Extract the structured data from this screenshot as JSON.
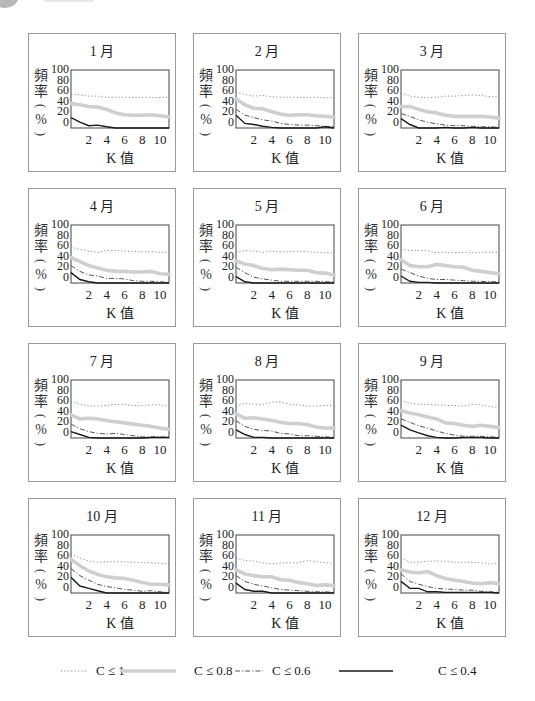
{
  "header": {
    "bullet_icon": "circle-bullet",
    "text": ""
  },
  "axes": {
    "ylabel": [
      "頻",
      "率",
      "(",
      "%",
      ")"
    ],
    "yticks": [
      "100",
      "80",
      "60",
      "40",
      "20",
      "0"
    ],
    "xticks": [
      "2",
      "4",
      "6",
      "8",
      "10"
    ],
    "xlabel": "K 值"
  },
  "legend": [
    {
      "key": "c1",
      "label": "C ≤ 1",
      "style": "dotted",
      "color": "#8c8c8c"
    },
    {
      "key": "c08",
      "label": "C ≤ 0.8",
      "style": "thick",
      "color": "#cfcfcf"
    },
    {
      "key": "c06",
      "label": "C ≤ 0.6",
      "style": "dash-dot",
      "color": "#555555"
    },
    {
      "key": "c04",
      "label": "C ≤ 0.4",
      "style": "solid",
      "color": "#1a1a1a"
    }
  ],
  "panels": [
    {
      "title": "1 月"
    },
    {
      "title": "2 月"
    },
    {
      "title": "3 月"
    },
    {
      "title": "4 月"
    },
    {
      "title": "5 月"
    },
    {
      "title": "6 月"
    },
    {
      "title": "7 月"
    },
    {
      "title": "8 月"
    },
    {
      "title": "9 月"
    },
    {
      "title": "10 月"
    },
    {
      "title": "11 月"
    },
    {
      "title": "12 月"
    }
  ],
  "chart_data": {
    "type": "line",
    "layout": "3x4 small multiples, one panel per month",
    "xlabel": "K 值",
    "ylabel": "頻率 (%)",
    "xlim": [
      0,
      11
    ],
    "ylim": [
      0,
      100
    ],
    "xticks": [
      2,
      4,
      6,
      8,
      10
    ],
    "yticks": [
      0,
      20,
      40,
      60,
      80,
      100
    ],
    "grid": false,
    "legend_position": "bottom",
    "x": [
      0,
      1,
      2,
      3,
      4,
      5,
      6,
      7,
      8,
      9,
      10,
      11
    ],
    "panels": [
      {
        "title": "1月",
        "series": [
          {
            "name": "C ≤ 1",
            "values": [
              58,
              57,
              55,
              55,
              53,
              53,
              53,
              53,
              53,
              52,
              53,
              53
            ]
          },
          {
            "name": "C ≤ 0.8",
            "values": [
              42,
              40,
              37,
              36,
              32,
              26,
              23,
              22,
              22,
              23,
              21,
              19
            ]
          },
          {
            "name": "C ≤ 0.6",
            "values": null
          },
          {
            "name": "C ≤ 0.4",
            "values": [
              18,
              10,
              4,
              5,
              2,
              0,
              0,
              0,
              0,
              0,
              0,
              0
            ]
          }
        ]
      },
      {
        "title": "2月",
        "series": [
          {
            "name": "C ≤ 1",
            "values": [
              62,
              58,
              55,
              56,
              54,
              53,
              53,
              53,
              53,
              53,
              52,
              52
            ]
          },
          {
            "name": "C ≤ 0.8",
            "values": [
              50,
              40,
              34,
              33,
              28,
              24,
              22,
              23,
              23,
              21,
              20,
              19
            ]
          },
          {
            "name": "C ≤ 0.6",
            "values": [
              32,
              22,
              18,
              14,
              12,
              8,
              6,
              5,
              5,
              4,
              3,
              2
            ]
          },
          {
            "name": "C ≤ 0.4",
            "values": [
              22,
              8,
              6,
              3,
              1,
              0,
              0,
              0,
              0,
              0,
              2,
              0
            ]
          }
        ]
      },
      {
        "title": "3月",
        "series": [
          {
            "name": "C ≤ 1",
            "values": [
              60,
              55,
              53,
              52,
              53,
              55,
              55,
              56,
              57,
              56,
              54,
              54
            ]
          },
          {
            "name": "C ≤ 0.8",
            "values": [
              37,
              37,
              32,
              28,
              26,
              22,
              20,
              20,
              20,
              20,
              19,
              17
            ]
          },
          {
            "name": "C ≤ 0.6",
            "values": [
              25,
              20,
              14,
              10,
              7,
              5,
              4,
              4,
              3,
              2,
              2,
              1
            ]
          },
          {
            "name": "C ≤ 0.4",
            "values": [
              16,
              6,
              0,
              0,
              0,
              1,
              0,
              0,
              1,
              0,
              0,
              0
            ]
          }
        ]
      },
      {
        "title": "4月",
        "series": [
          {
            "name": "C ≤ 1",
            "values": [
              62,
              58,
              55,
              53,
              56,
              56,
              55,
              54,
              54,
              54,
              53,
              53
            ]
          },
          {
            "name": "C ≤ 0.8",
            "values": [
              44,
              37,
              30,
              26,
              22,
              20,
              20,
              19,
              19,
              20,
              16,
              15
            ]
          },
          {
            "name": "C ≤ 0.6",
            "values": [
              30,
              20,
              14,
              12,
              8,
              8,
              7,
              4,
              3,
              3,
              2,
              1
            ]
          },
          {
            "name": "C ≤ 0.4",
            "values": [
              18,
              6,
              2,
              0,
              0,
              0,
              0,
              0,
              0,
              0,
              0,
              0
            ]
          }
        ]
      },
      {
        "title": "5月",
        "series": [
          {
            "name": "C ≤ 1",
            "values": [
              53,
              56,
              55,
              53,
              55,
              54,
              54,
              55,
              54,
              53,
              52,
              52
            ]
          },
          {
            "name": "C ≤ 0.8",
            "values": [
              38,
              33,
              30,
              25,
              23,
              24,
              23,
              22,
              22,
              18,
              17,
              14
            ]
          },
          {
            "name": "C ≤ 0.6",
            "values": [
              27,
              18,
              10,
              7,
              5,
              3,
              3,
              3,
              3,
              3,
              2,
              2
            ]
          },
          {
            "name": "C ≤ 0.4",
            "values": [
              11,
              2,
              0,
              0,
              0,
              0,
              0,
              0,
              0,
              0,
              0,
              0
            ]
          }
        ]
      },
      {
        "title": "6月",
        "series": [
          {
            "name": "C ≤ 1",
            "values": [
              58,
              56,
              56,
              56,
              52,
              53,
              52,
              53,
              52,
              53,
              53,
              53
            ]
          },
          {
            "name": "C ≤ 0.8",
            "values": [
              40,
              30,
              28,
              28,
              32,
              30,
              28,
              27,
              22,
              20,
              18,
              16
            ]
          },
          {
            "name": "C ≤ 0.6",
            "values": [
              24,
              18,
              12,
              8,
              6,
              6,
              5,
              4,
              3,
              3,
              2,
              2
            ]
          },
          {
            "name": "C ≤ 0.4",
            "values": [
              12,
              3,
              1,
              1,
              0,
              0,
              0,
              0,
              0,
              0,
              0,
              0
            ]
          }
        ]
      },
      {
        "title": "7月",
        "series": [
          {
            "name": "C ≤ 1",
            "values": [
              63,
              58,
              55,
              55,
              56,
              58,
              58,
              56,
              56,
              57,
              57,
              55
            ]
          },
          {
            "name": "C ≤ 0.8",
            "values": [
              40,
              33,
              34,
              33,
              30,
              28,
              26,
              24,
              22,
              20,
              17,
              15
            ]
          },
          {
            "name": "C ≤ 0.6",
            "values": [
              24,
              16,
              11,
              8,
              7,
              8,
              6,
              4,
              2,
              2,
              2,
              1
            ]
          },
          {
            "name": "C ≤ 0.4",
            "values": [
              11,
              6,
              1,
              0,
              0,
              0,
              0,
              0,
              0,
              1,
              1,
              1
            ]
          }
        ]
      },
      {
        "title": "8月",
        "series": [
          {
            "name": "C ≤ 1",
            "values": [
              55,
              60,
              58,
              58,
              62,
              62,
              58,
              57,
              55,
              55,
              56,
              56
            ]
          },
          {
            "name": "C ≤ 0.8",
            "values": [
              42,
              34,
              35,
              33,
              30,
              27,
              25,
              25,
              23,
              19,
              17,
              17
            ]
          },
          {
            "name": "C ≤ 0.6",
            "values": [
              30,
              20,
              15,
              13,
              12,
              8,
              7,
              4,
              4,
              3,
              2,
              1
            ]
          },
          {
            "name": "C ≤ 0.4",
            "values": [
              14,
              6,
              1,
              1,
              0,
              0,
              0,
              0,
              0,
              0,
              0,
              0
            ]
          }
        ]
      },
      {
        "title": "9月",
        "series": [
          {
            "name": "C ≤ 1",
            "values": [
              65,
              60,
              58,
              58,
              57,
              56,
              56,
              55,
              58,
              57,
              54,
              53
            ]
          },
          {
            "name": "C ≤ 0.8",
            "values": [
              47,
              43,
              40,
              36,
              33,
              26,
              25,
              22,
              20,
              22,
              20,
              18
            ]
          },
          {
            "name": "C ≤ 0.6",
            "values": [
              33,
              27,
              21,
              17,
              12,
              8,
              5,
              3,
              3,
              3,
              2,
              1
            ]
          },
          {
            "name": "C ≤ 0.4",
            "values": [
              22,
              14,
              9,
              4,
              1,
              0,
              0,
              1,
              1,
              1,
              0,
              0
            ]
          }
        ]
      },
      {
        "title": "10月",
        "series": [
          {
            "name": "C ≤ 1",
            "values": [
              67,
              60,
              55,
              53,
              54,
              54,
              54,
              53,
              52,
              52,
              51,
              50
            ]
          },
          {
            "name": "C ≤ 0.8",
            "values": [
              58,
              47,
              38,
              32,
              28,
              26,
              25,
              22,
              18,
              15,
              15,
              14
            ]
          },
          {
            "name": "C ≤ 0.6",
            "values": [
              42,
              30,
              22,
              15,
              11,
              9,
              6,
              5,
              3,
              4,
              2,
              1
            ]
          },
          {
            "name": "C ≤ 0.4",
            "values": [
              27,
              12,
              8,
              4,
              0,
              0,
              0,
              0,
              0,
              0,
              0,
              0
            ]
          }
        ]
      },
      {
        "title": "11月",
        "series": [
          {
            "name": "C ≤ 1",
            "values": [
              60,
              56,
              55,
              52,
              50,
              52,
              52,
              52,
              56,
              54,
              52,
              51
            ]
          },
          {
            "name": "C ≤ 0.8",
            "values": [
              40,
              33,
              30,
              28,
              28,
              23,
              22,
              18,
              16,
              13,
              14,
              13
            ]
          },
          {
            "name": "C ≤ 0.6",
            "values": [
              30,
              20,
              15,
              12,
              9,
              6,
              5,
              4,
              3,
              2,
              2,
              1
            ]
          },
          {
            "name": "C ≤ 0.4",
            "values": [
              17,
              6,
              3,
              3,
              0,
              0,
              0,
              0,
              0,
              0,
              0,
              0
            ]
          }
        ]
      },
      {
        "title": "12月",
        "series": [
          {
            "name": "C ≤ 1",
            "values": [
              60,
              53,
              53,
              55,
              55,
              55,
              53,
              53,
              53,
              52,
              50,
              51
            ]
          },
          {
            "name": "C ≤ 0.8",
            "values": [
              40,
              36,
              35,
              37,
              30,
              25,
              22,
              20,
              17,
              16,
              18,
              16
            ]
          },
          {
            "name": "C ≤ 0.6",
            "values": [
              33,
              20,
              15,
              11,
              8,
              7,
              6,
              5,
              5,
              3,
              2,
              1
            ]
          },
          {
            "name": "C ≤ 0.4",
            "values": [
              20,
              8,
              8,
              2,
              2,
              1,
              1,
              1,
              1,
              1,
              1,
              0
            ]
          }
        ]
      }
    ]
  }
}
